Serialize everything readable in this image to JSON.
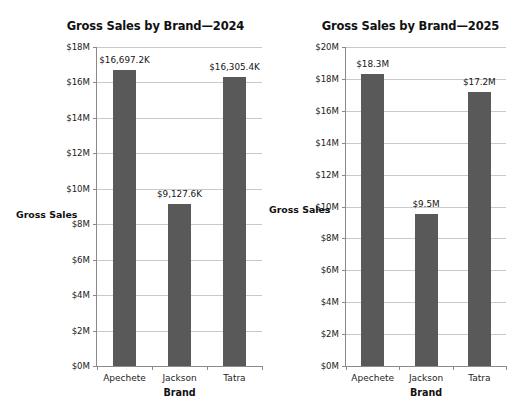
{
  "chart_data": [
    {
      "type": "bar",
      "title": "Gross Sales by Brand—2024",
      "xlabel": "Brand",
      "ylabel": "Gross Sales",
      "categories": [
        "Apechete",
        "Jackson",
        "Tatra"
      ],
      "values": [
        16697.2,
        9127.6,
        16305.4
      ],
      "value_unit": "thousands of dollars",
      "data_labels": [
        "$16,697.2K",
        "$9,127.6K",
        "$16,305.4K"
      ],
      "ylim": [
        0,
        18000
      ],
      "yticks": [
        0,
        2000,
        4000,
        6000,
        8000,
        10000,
        12000,
        14000,
        16000,
        18000
      ],
      "ytick_labels": [
        "$0M",
        "$2M",
        "$4M",
        "$6M",
        "$8M",
        "$10M",
        "$12M",
        "$14M",
        "$16M",
        "$18M"
      ],
      "grid": true,
      "legend": "none",
      "bar_color": "#595959"
    },
    {
      "type": "bar",
      "title": "Gross Sales by Brand—2025",
      "xlabel": "Brand",
      "ylabel": "Gross Sales",
      "categories": [
        "Apechete",
        "Jackson",
        "Tatra"
      ],
      "values": [
        18.3,
        9.5,
        17.2
      ],
      "value_unit": "millions of dollars",
      "data_labels": [
        "$18.3M",
        "$9.5M",
        "$17.2M"
      ],
      "ylim": [
        0,
        20
      ],
      "yticks": [
        0,
        2,
        4,
        6,
        8,
        10,
        12,
        14,
        16,
        18,
        20
      ],
      "ytick_labels": [
        "$0M",
        "$2M",
        "$4M",
        "$6M",
        "$8M",
        "$10M",
        "$12M",
        "$14M",
        "$16M",
        "$18M",
        "$20M"
      ],
      "grid": true,
      "legend": "none",
      "bar_color": "#595959"
    }
  ],
  "colors": {
    "bar": "#595959",
    "grid": "#c9c9c9",
    "axis": "#8a8a8a",
    "text": "#1a1a1a",
    "background": "#ffffff"
  }
}
